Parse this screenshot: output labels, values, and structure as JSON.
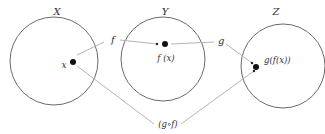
{
  "diagram": {
    "sets": [
      {
        "id": "X",
        "label": "X",
        "cx": 54,
        "cy": 61,
        "r": 44
      },
      {
        "id": "Y",
        "label": "Y",
        "cx": 163,
        "cy": 59,
        "r": 42
      },
      {
        "id": "Z",
        "label": "Z",
        "cx": 283,
        "cy": 66,
        "r": 42
      }
    ],
    "points": [
      {
        "id": "x",
        "label": "x",
        "set": "X"
      },
      {
        "id": "fx",
        "label": "f (x)",
        "set": "Y"
      },
      {
        "id": "gfx",
        "label": "g(f(x))",
        "set": "Z"
      }
    ],
    "arrows": [
      {
        "id": "f",
        "label": "f",
        "from": "x",
        "to": "fx"
      },
      {
        "id": "g",
        "label": "g",
        "from": "fx",
        "to": "gfx"
      },
      {
        "id": "gof",
        "label": "(g∘f)",
        "from": "x",
        "to": "gfx"
      }
    ],
    "colors": {
      "circle": "#555555",
      "arrow": "#b0b0b0",
      "dot": "#111111",
      "text": "#333333"
    }
  }
}
